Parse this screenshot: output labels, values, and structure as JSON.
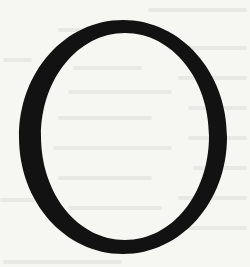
{
  "image": {
    "description": "Scanned page showing a single large serif capital letter",
    "letter": "O",
    "colors": {
      "paper": "#f6f6f3",
      "ink": "#121212",
      "bleed_through": "#e4e4e0"
    }
  }
}
